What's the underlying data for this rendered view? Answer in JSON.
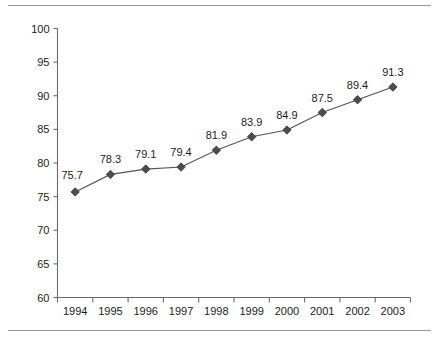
{
  "chart_data": {
    "type": "line",
    "title": "",
    "xlabel": "",
    "ylabel": "",
    "categories": [
      "1994",
      "1995",
      "1996",
      "1997",
      "1998",
      "1999",
      "2000",
      "2001",
      "2002",
      "2003"
    ],
    "values": [
      75.7,
      78.3,
      79.1,
      79.4,
      81.9,
      83.9,
      84.9,
      87.5,
      89.4,
      91.3
    ],
    "data_labels": [
      "75.7",
      "78.3",
      "79.1",
      "79.4",
      "81.9",
      "83.9",
      "84.9",
      "87.5",
      "89.4",
      "91.3"
    ],
    "ylim": [
      60,
      100
    ],
    "y_ticks": [
      60,
      65,
      70,
      75,
      80,
      85,
      90,
      95,
      100
    ],
    "y_tick_labels": [
      "60",
      "65",
      "70",
      "75",
      "80",
      "85",
      "90",
      "95",
      "100"
    ],
    "grid": false,
    "legend": null,
    "legend_position": "none",
    "marker": "diamond",
    "series_color": "#555555",
    "marker_color": "#4d4d4d",
    "axis_color": "#6b6b6b",
    "rule_color": "#9a9a9a",
    "text_color": "#1a1a1a"
  }
}
